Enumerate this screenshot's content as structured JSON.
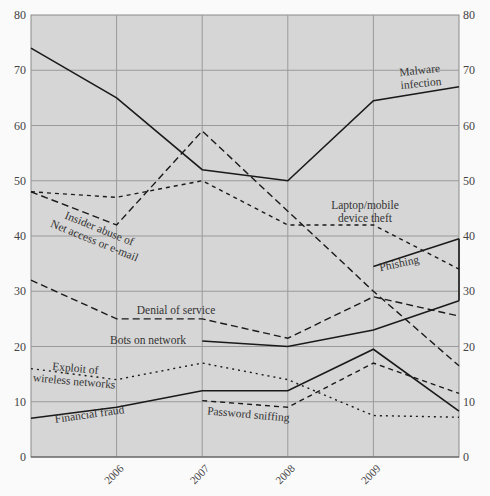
{
  "chart_data": {
    "type": "line",
    "title": "",
    "xlabel": "",
    "ylabel": "",
    "x": [
      2005,
      2006,
      2007,
      2008,
      2009,
      2010
    ],
    "x_tick_labels": [
      "2006",
      "2007",
      "2008",
      "2009"
    ],
    "y_ticks": [
      0,
      10,
      20,
      30,
      40,
      50,
      60,
      70,
      80
    ],
    "ylim": [
      0,
      80
    ],
    "xlim": [
      2005,
      2010
    ],
    "grid": true,
    "y_axis_both_sides": true,
    "legend": "inline annotations",
    "series": [
      {
        "name": "Malware infection",
        "style": "solid",
        "values": [
          74,
          65,
          52,
          50,
          64.5,
          67
        ],
        "label_lines": [
          "Malware",
          "infection"
        ],
        "label_pos": [
          420,
          74
        ],
        "label_rot": -6
      },
      {
        "name": "Insider abuse of Net access or e-mail",
        "style": "longdash",
        "values": [
          48,
          42,
          59,
          44.5,
          30,
          16.5
        ],
        "label_lines": [
          "Insider abuse of",
          "Net access or e-mail"
        ],
        "label_pos": [
          98,
          232
        ],
        "label_rot": 22
      },
      {
        "name": "Laptop/mobile device theft",
        "style": "shortdash",
        "values": [
          48,
          47,
          50,
          42,
          42,
          34
        ],
        "label_lines": [
          "Laptop/mobile",
          "device theft"
        ],
        "label_pos": [
          365,
          209
        ],
        "label_rot": 0
      },
      {
        "name": "Phishing",
        "style": "solid",
        "values": [
          null,
          null,
          null,
          null,
          34.5,
          39.5
        ],
        "label_lines": [
          "Phishing"
        ],
        "label_pos": [
          400,
          267
        ],
        "label_rot": -12
      },
      {
        "name": "Denial of service",
        "style": "longdash",
        "values": [
          32,
          25,
          25,
          21.5,
          29,
          25.5
        ],
        "label_lines": [
          "Denial of service"
        ],
        "label_pos": [
          176,
          314
        ],
        "label_rot": 0
      },
      {
        "name": "Bots on network",
        "style": "solid",
        "values": [
          null,
          null,
          21,
          20,
          23,
          28.3
        ],
        "label_lines": [
          "Bots on network"
        ],
        "label_pos": [
          148,
          344
        ],
        "label_rot": 0
      },
      {
        "name": "Exploit of wireless networks",
        "style": "dotted",
        "values": [
          16,
          14,
          17,
          14,
          7.5,
          7.2
        ],
        "label_lines": [
          "Exploit of",
          "wireless networks"
        ],
        "label_pos": [
          75,
          372
        ],
        "label_rot": 5
      },
      {
        "name": "Financial fraud",
        "style": "solid",
        "values": [
          7,
          9,
          12,
          12,
          19.5,
          8.3
        ],
        "label_lines": [
          "Financial fraud"
        ],
        "label_pos": [
          90,
          418
        ],
        "label_rot": -8
      },
      {
        "name": "Password sniffing",
        "style": "mediumdash",
        "values": [
          null,
          null,
          10.2,
          9,
          17,
          11.5
        ],
        "label_lines": [
          "Password sniffing"
        ],
        "label_pos": [
          248,
          418
        ],
        "label_rot": 5
      }
    ],
    "colors": {
      "plot_bg": "#d6d6d6",
      "page_bg": "#fafafa",
      "grid": "#9a9a9a",
      "line": "#1a1a1a",
      "text": "#333333"
    }
  }
}
